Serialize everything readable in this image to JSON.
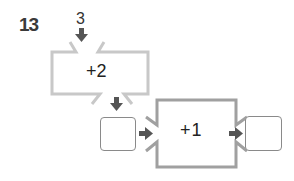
{
  "problem": {
    "number": "13"
  },
  "start_value": "3",
  "machines": [
    {
      "operation": "+2",
      "style": "light"
    },
    {
      "operation": "+1",
      "style": "dark"
    }
  ],
  "answer_boxes": [
    {
      "value": ""
    },
    {
      "value": ""
    }
  ],
  "colors": {
    "machine1_stroke": "#c8c8c8",
    "machine2_stroke": "#a0a0a0",
    "arrow": "#555555",
    "box_border": "#8a8a8a"
  }
}
